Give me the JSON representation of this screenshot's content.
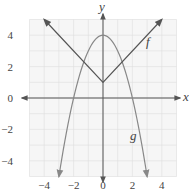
{
  "chart_data": {
    "type": "line",
    "title": "",
    "xlabel": "x",
    "ylabel": "y",
    "xlim": [
      -5,
      5
    ],
    "ylim": [
      -5,
      5
    ],
    "grid": true,
    "x_ticks": [
      "-4",
      "-2",
      "0",
      "2",
      "4"
    ],
    "y_ticks": [
      "4",
      "2",
      "0",
      "-2",
      "-4"
    ],
    "series": [
      {
        "name": "f",
        "label": "f",
        "formula": "f(x) = |x| + 1",
        "shape": "absolute value V",
        "points": [
          [
            -4,
            5
          ],
          [
            0,
            1
          ],
          [
            4,
            5
          ]
        ],
        "color": "#555555"
      },
      {
        "name": "g",
        "label": "g",
        "formula": "g(x) = 4 - x^2",
        "shape": "downward parabola",
        "points": [
          [
            -3,
            -5
          ],
          [
            -2,
            0
          ],
          [
            0,
            4
          ],
          [
            2,
            0
          ],
          [
            3,
            -5
          ]
        ],
        "color": "#888888"
      }
    ]
  },
  "labels": {
    "x_axis": "x",
    "y_axis": "y",
    "f": "f",
    "g": "g",
    "xt": [
      "−4",
      "−2",
      "0",
      "2",
      "4"
    ],
    "yt": [
      "4",
      "2",
      "0",
      "−2",
      "−4"
    ]
  }
}
